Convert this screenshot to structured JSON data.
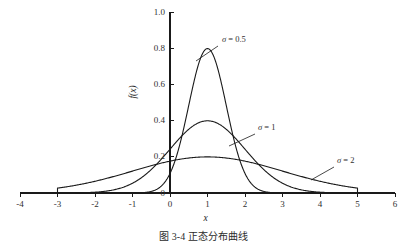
{
  "figure": {
    "caption": "图 3-4  正态分布曲线"
  },
  "chart_data": {
    "type": "line",
    "title": "",
    "xlabel": "x",
    "ylabel": "f(x)",
    "xlim": [
      -4,
      6
    ],
    "ylim": [
      0,
      1.0
    ],
    "grid": false,
    "legend_position": "inline-annotations",
    "xticks": [
      -4,
      -3,
      -2,
      -1,
      0,
      1,
      2,
      3,
      4,
      5,
      6
    ],
    "xtick_labels": [
      "-4",
      "-3",
      "-2",
      "-1",
      "0",
      "1",
      "2",
      "3",
      "4",
      "5",
      "6"
    ],
    "yticks": [
      0,
      0.2,
      0.4,
      0.6,
      0.8,
      1.0
    ],
    "ytick_labels": [
      "0",
      "0.2",
      "0.4",
      "0.6",
      "0.8",
      "1.0"
    ],
    "distribution": "normal",
    "mu": 1,
    "series": [
      {
        "name": "sigma-0.5",
        "label": "σ = 0.5",
        "sigma": 0.5,
        "peak_x": 1,
        "peak_y": 0.8,
        "domain": [
          -0.75,
          2.75
        ],
        "color": "#1a1a1a"
      },
      {
        "name": "sigma-1",
        "label": "σ = 1",
        "sigma": 1,
        "peak_x": 1,
        "peak_y": 0.4,
        "domain": [
          -2.5,
          4.5
        ],
        "color": "#1a1a1a"
      },
      {
        "name": "sigma-2",
        "label": "σ = 2",
        "sigma": 2,
        "peak_x": 1,
        "peak_y": 0.2,
        "domain": [
          -3,
          5
        ],
        "color": "#1a1a1a"
      }
    ],
    "annotations": [
      {
        "name": "sigma-0.5",
        "text": "σ = 0.5",
        "label_x": 222,
        "label_y": 40,
        "leader_from": [
          218,
          46
        ],
        "leader_to": [
          196,
          61
        ]
      },
      {
        "name": "sigma-1",
        "text": "σ = 1",
        "label_x": 258,
        "label_y": 128,
        "leader_from": [
          255,
          134
        ],
        "leader_to": [
          229,
          146
        ]
      },
      {
        "name": "sigma-2",
        "text": "σ = 2",
        "label_x": 337,
        "label_y": 161,
        "leader_from": [
          334,
          167
        ],
        "leader_to": [
          311,
          180
        ]
      }
    ]
  },
  "axis_colors": {
    "axis": "#1a1a1a",
    "curve": "#1a1a1a",
    "text": "#2b2b2b"
  }
}
